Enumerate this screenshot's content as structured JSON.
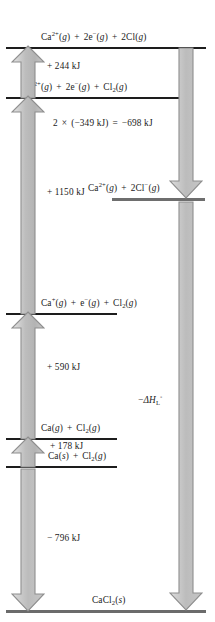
{
  "diagram": {
    "type": "energy-level-diagram",
    "colors": {
      "line_dark": "#1d1d1d",
      "line_grey": "#6e6e6e",
      "arrow_light": "#e8e8e8",
      "arrow_mid": "#b9b9b9",
      "arrow_edge": "#8a8a8a",
      "text": "#1a1a1a",
      "background": "#ffffff"
    },
    "levels": [
      {
        "id": "level-1",
        "label_html": "Ca<sup>2+</sup>(<i>g</i>) <span class=\"op\">+</span> 2e<sup>&#8722;</sup>(<i>g</i>) <span class=\"op\">+</span> 2Cl(<i>g</i>)",
        "label_text": "Ca2+(g) + 2e-(g) + 2Cl(g)"
      },
      {
        "id": "level-2",
        "label_html": "Ca<sup>2+</sup>(<i>g</i>) <span class=\"op\">+</span> 2e<sup>&#8722;</sup>(<i>g</i>) <span class=\"op\">+</span> Cl<sub>2</sub>(<i>g</i>)",
        "label_text": "Ca2+(g) + 2e-(g) + Cl2(g)"
      },
      {
        "id": "level-3",
        "label_html": "Ca<sup>2+</sup>(<i>g</i>) <span class=\"op\">+</span> 2Cl<sup>&#8722;</sup>(<i>g</i>)",
        "label_text": "Ca2+(g) + 2Cl-(g)"
      },
      {
        "id": "level-4",
        "label_html": "Ca<sup>+</sup>(<i>g</i>) <span class=\"op\">+</span> e<sup>&#8722;</sup>(<i>g</i>) <span class=\"op\">+</span> Cl<sub>2</sub>(<i>g</i>)",
        "label_text": "Ca+(g) + e-(g) + Cl2(g)"
      },
      {
        "id": "level-5",
        "label_html": "Ca(<i>g</i>) <span class=\"op\">+</span> Cl<sub>2</sub>(<i>g</i>)",
        "label_text": "Ca(g) + Cl2(g)"
      },
      {
        "id": "level-6",
        "label_html": "Ca(<i>s</i>) <span class=\"op\">+</span> Cl<sub>2</sub>(<i>g</i>)",
        "label_text": "Ca(s) + Cl2(g)"
      },
      {
        "id": "level-7",
        "label_html": "CaCl<sub>2</sub>(<i>s</i>)",
        "label_text": "CaCl2(s)"
      }
    ],
    "steps": [
      {
        "id": "step-second-ionization",
        "label_text": "+ 244 kJ",
        "label_html": "+ 244 kJ",
        "value_kj": 244,
        "direction": "up"
      },
      {
        "id": "step-electron-affinity",
        "label_text": "2 × (−349 kJ) = −698 kJ",
        "label_html": "2 <span class=\"op\">&#215;</span> (&#8722;349 kJ) <span class=\"op\">=</span> &#8722;698 kJ",
        "value_kj": -698,
        "per_atom_kj": -349,
        "direction": "down"
      },
      {
        "id": "step-dissociation",
        "label_text": "+ 1150 kJ",
        "label_html": "+ 1150 kJ",
        "value_kj": 1150,
        "direction": "up"
      },
      {
        "id": "step-first-ionization",
        "label_text": "+ 590 kJ",
        "label_html": "+ 590 kJ",
        "value_kj": 590,
        "direction": "up"
      },
      {
        "id": "step-sublimation",
        "label_text": "+ 178 kJ",
        "label_html": "+ 178 kJ",
        "value_kj": 178,
        "direction": "up"
      },
      {
        "id": "step-formation",
        "label_text": "− 796 kJ",
        "label_html": "&#8722; 796 kJ",
        "value_kj": -796,
        "direction": "down"
      },
      {
        "id": "step-lattice-enthalpy",
        "label_text": "−ΔH°L",
        "label_html": "&#8722;<span class=\"mathsym\">&#916;</span><i>H</i><sub>L</sub><sup>&#9702;</sup>",
        "direction": "down"
      }
    ]
  }
}
